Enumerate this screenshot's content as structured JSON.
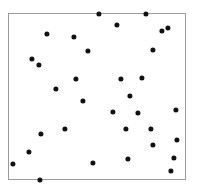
{
  "figure": {
    "width": 200,
    "height": 191,
    "background_color": "#ffffff"
  },
  "plot": {
    "frame_left": 8,
    "frame_top": 13,
    "frame_right": 186,
    "frame_bottom": 180,
    "frame_color": "#9a9a9a",
    "frame_width_px": 1,
    "point_color": "#111111",
    "point_diameter_px": 5.2
  },
  "chart_data": {
    "type": "scatter",
    "title": "",
    "subtitle": "",
    "xlabel": "",
    "ylabel": "",
    "grid": false,
    "legend": null,
    "legend_position": "none",
    "xlim": [
      0,
      100
    ],
    "ylim": [
      0,
      100
    ],
    "xticks": [],
    "yticks": [],
    "xtick_labels": [],
    "ytick_labels": [],
    "annotations": [],
    "series": [
      {
        "name": "points",
        "marker": "circle",
        "color": "#111111",
        "size_px": 5.2,
        "n_points": 33,
        "x": [
          51.1,
          28.1,
          62.0,
          37.1,
          17.4,
          44.9,
          86.5,
          61.2,
          77.5,
          94.4,
          38.2,
          17.4,
          26.4,
          63.5,
          81.5,
          42.1,
          72.5,
          94.4,
          59.0,
          32.0,
          73.6,
          22.5,
          66.3,
          80.3,
          94.4,
          18.5,
          11.8,
          81.5,
          8.4,
          67.4,
          2.8,
          44.9,
          94.4
        ],
        "y": [
          99.4,
          89.8,
          99.4,
          92.6,
          83.2,
          75.4,
          80.8,
          70.1,
          69.5,
          70.1,
          68.9,
          62.3,
          54.5,
          60.5,
          60.5,
          53.3,
          53.3,
          50.3,
          48.5,
          47.3,
          43.7,
          38.9,
          39.5,
          39.5,
          31.1,
          30.5,
          27.5,
          27.5,
          20.4,
          21.0,
          9.6,
          8.4,
          13.2
        ],
        "points_px": [
          {
            "x": 99,
            "y": 14
          },
          {
            "x": 47,
            "y": 34
          },
          {
            "x": 117,
            "y": 25
          },
          {
            "x": 74,
            "y": 37
          },
          {
            "x": 39,
            "y": 65
          },
          {
            "x": 88,
            "y": 51
          },
          {
            "x": 162,
            "y": 31
          },
          {
            "x": 146,
            "y": 14
          },
          {
            "x": 153,
            "y": 50
          },
          {
            "x": 168,
            "y": 28
          },
          {
            "x": 76,
            "y": 79
          },
          {
            "x": 32,
            "y": 59
          },
          {
            "x": 56,
            "y": 89
          },
          {
            "x": 121,
            "y": 79
          },
          {
            "x": 142,
            "y": 78
          },
          {
            "x": 83,
            "y": 101
          },
          {
            "x": 130,
            "y": 96
          },
          {
            "x": 176,
            "y": 110
          },
          {
            "x": 113,
            "y": 112
          },
          {
            "x": 65,
            "y": 129
          },
          {
            "x": 138,
            "y": 113
          },
          {
            "x": 41,
            "y": 134
          },
          {
            "x": 126,
            "y": 129
          },
          {
            "x": 151,
            "y": 129
          },
          {
            "x": 177,
            "y": 140
          },
          {
            "x": 29,
            "y": 152
          },
          {
            "x": 13,
            "y": 164
          },
          {
            "x": 153,
            "y": 145
          },
          {
            "x": 128,
            "y": 159
          },
          {
            "x": 174,
            "y": 158
          },
          {
            "x": 40,
            "y": 180
          },
          {
            "x": 93,
            "y": 163
          },
          {
            "x": 171,
            "y": 171
          }
        ]
      }
    ]
  }
}
